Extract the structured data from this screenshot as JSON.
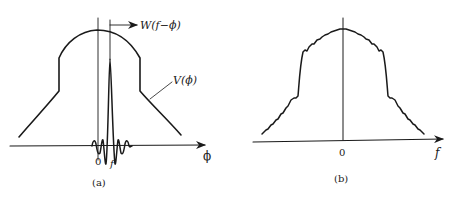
{
  "figure": {
    "panels": [
      {
        "id": "a",
        "caption": "(a)",
        "curve_labels": {
          "window": "W(f−ϕ)",
          "spectrum": "V(ϕ)"
        },
        "axis_label": "ϕ",
        "tick_zero": "0",
        "tick_f": "f"
      },
      {
        "id": "b",
        "caption": "(b)",
        "axis_label": "f",
        "tick_zero": "0"
      }
    ],
    "colors": {
      "ink": "#1a1a1a",
      "background": "#ffffff"
    }
  }
}
